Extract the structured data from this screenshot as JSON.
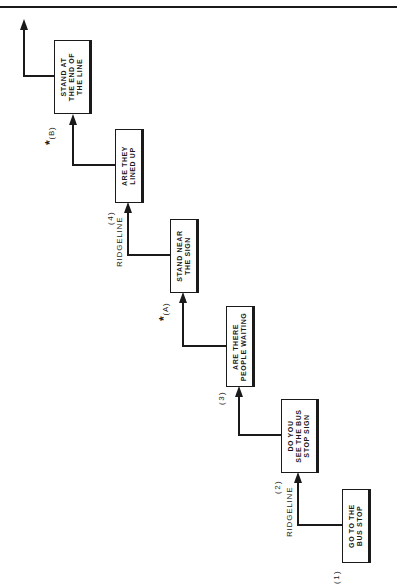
{
  "diagram": {
    "title": "",
    "orientation": "rotated-90-ccw",
    "boxes": [
      {
        "id": "box1",
        "label": "GO TO THE\nBUS STOP"
      },
      {
        "id": "box2",
        "label": "DO YOU\nSEE THE BUS\nSTOP SIGN"
      },
      {
        "id": "box3",
        "label": "ARE THERE\nPEOPLE WAITING"
      },
      {
        "id": "box4",
        "label": "STAND NEAR\nTHE SIGN"
      },
      {
        "id": "box5",
        "label": "ARE THEY\nLINED UP"
      },
      {
        "id": "box6",
        "label": "STAND AT\nTHE END OF\nTHE LINE"
      }
    ],
    "step_labels": [
      "(1)",
      "(2)",
      "(3)",
      "(4)"
    ],
    "ridgeline_label": "RIDGELINE",
    "annotations": [
      {
        "id": "A",
        "star": "*",
        "label": "(A)"
      },
      {
        "id": "B",
        "star": "*",
        "label": "(B)"
      }
    ],
    "colors": {
      "line": "#1a1a1a",
      "background": "#ffffff"
    }
  }
}
